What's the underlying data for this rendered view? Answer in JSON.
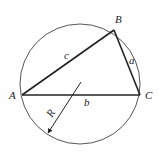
{
  "diagram": {
    "colors": {
      "stroke": "#222222",
      "circle": "#555555",
      "background": "#ffffff"
    },
    "circle": {
      "cx": 80,
      "cy": 84,
      "r": 60
    },
    "vertices": {
      "A": {
        "label": "A",
        "x": 22,
        "y": 95
      },
      "B": {
        "label": "B",
        "x": 114,
        "y": 30
      },
      "C": {
        "label": "C",
        "x": 140,
        "y": 95
      }
    },
    "sides": {
      "a": {
        "label": "a",
        "between": "B-C"
      },
      "b": {
        "label": "b",
        "between": "A-C"
      },
      "c": {
        "label": "c",
        "between": "A-B"
      }
    },
    "radius": {
      "label": "R",
      "from": [
        80,
        84
      ],
      "to": [
        48,
        134
      ]
    }
  }
}
